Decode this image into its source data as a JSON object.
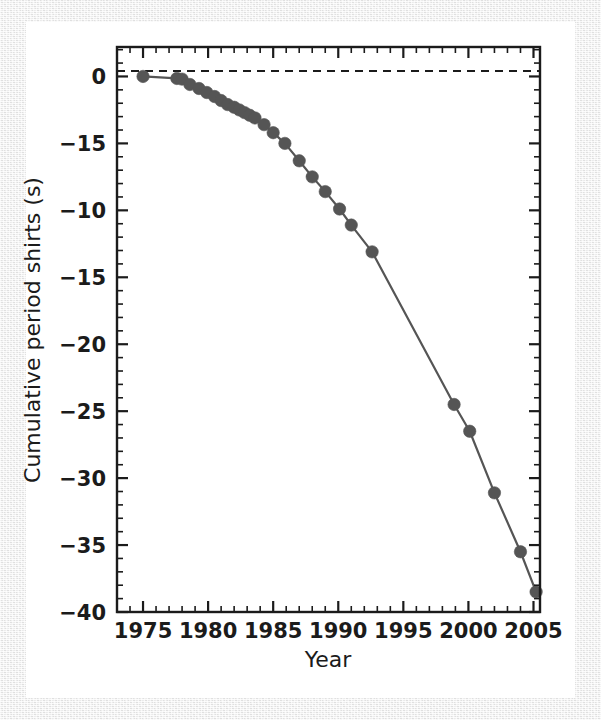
{
  "figure": {
    "background_color": "#ffffff",
    "frame_color": "#ececec",
    "axis_color": "#1b1b1b",
    "series_color": "#555555",
    "zero_line_color": "#1b1b1b"
  },
  "axes": {
    "x_title": "Year",
    "y_title": "Cumulative period shirts (s)",
    "x_tick_labels": [
      "1975",
      "1980",
      "1985",
      "1990",
      "1995",
      "2000",
      "2005"
    ],
    "y_tick_labels": [
      "0",
      "−15",
      "−10",
      "−15",
      "−20",
      "−25",
      "−30",
      "−35",
      "−40"
    ]
  },
  "chart_data": {
    "type": "line",
    "title": "",
    "xlabel": "Year",
    "ylabel": "Cumulative period shirts (s)",
    "xlim": [
      1973,
      2005.5
    ],
    "ylim": [
      -40,
      2.2
    ],
    "xticks": [
      1975,
      1980,
      1985,
      1990,
      1995,
      2000,
      2005
    ],
    "xticklabels": [
      "1975",
      "1980",
      "1985",
      "1990",
      "1995",
      "2000",
      "2005"
    ],
    "yticks": [
      0,
      -5,
      -10,
      -15,
      -20,
      -25,
      -30,
      -35,
      -40
    ],
    "yticklabels": [
      "0",
      "−15",
      "−10",
      "−15",
      "−20",
      "−25",
      "−30",
      "−35",
      "−40"
    ],
    "x_minor_tick_step": 1,
    "y_minor_tick_step": 1,
    "grid": false,
    "legend": null,
    "tick_direction": "in",
    "ticks_on_all_sides": true,
    "marker": "circle",
    "marker_color": "#555555",
    "line_color": "#555555",
    "annotations": [
      {
        "type": "horizontal_reference_line",
        "y": 0,
        "style": "dashed",
        "color": "#1b1b1b"
      }
    ],
    "series": [
      {
        "name": "Cumulative period shift",
        "x": [
          1975.0,
          1977.6,
          1978.0,
          1978.6,
          1979.3,
          1979.9,
          1980.5,
          1981.0,
          1981.5,
          1982.0,
          1982.4,
          1982.8,
          1983.2,
          1983.6,
          1984.3,
          1985.0,
          1985.9,
          1987.0,
          1988.0,
          1989.0,
          1990.1,
          1991.0,
          1992.6,
          1998.9,
          2000.1,
          2002.0,
          2004.0,
          2005.2
        ],
        "y": [
          0.0,
          -0.15,
          -0.2,
          -0.6,
          -0.9,
          -1.2,
          -1.5,
          -1.8,
          -2.1,
          -2.3,
          -2.5,
          -2.7,
          -2.9,
          -3.1,
          -3.6,
          -4.2,
          -5.0,
          -6.3,
          -7.5,
          -8.6,
          -9.9,
          -11.1,
          -13.1,
          -24.5,
          -26.5,
          -31.1,
          -35.5,
          -38.5
        ]
      }
    ]
  }
}
